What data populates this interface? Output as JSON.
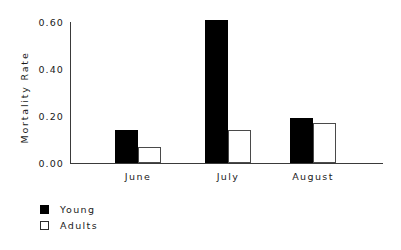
{
  "chart_data": {
    "type": "bar",
    "title": "",
    "xlabel": "",
    "ylabel": "Mortality Rate",
    "categories": [
      "June",
      "July",
      "August"
    ],
    "series": [
      {
        "name": "Young",
        "values": [
          0.14,
          0.61,
          0.19
        ],
        "color": "#000000",
        "fill": "solid"
      },
      {
        "name": "Adults",
        "values": [
          0.07,
          0.14,
          0.17
        ],
        "color": "#ffffff",
        "fill": "open"
      }
    ],
    "ylim": [
      0.0,
      0.6
    ],
    "yticks": [
      "0.00",
      "0.20",
      "0.40",
      "0.60"
    ],
    "ytick_values": [
      0.0,
      0.2,
      0.4,
      0.6
    ],
    "grid": false,
    "legend_position": "below-left",
    "legend": [
      {
        "label": "Young",
        "swatch": "filled-square"
      },
      {
        "label": "Adults",
        "swatch": "open-square"
      }
    ]
  }
}
